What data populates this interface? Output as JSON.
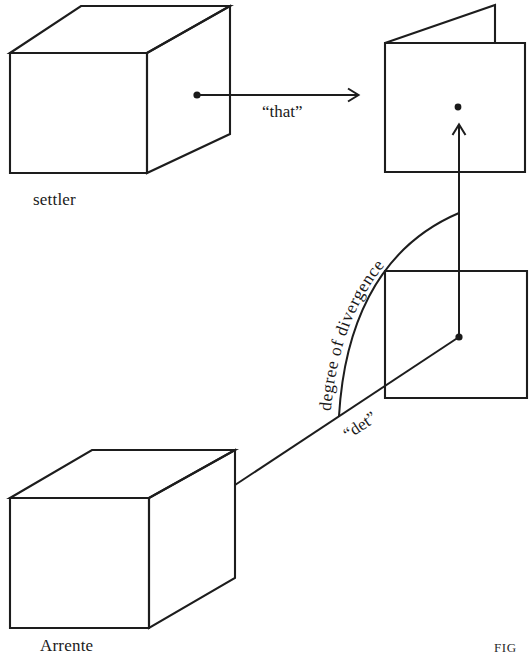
{
  "figure": {
    "caption_fragment": "FIG"
  },
  "labels": {
    "top_cube": "settler",
    "bottom_cube": "Arrente",
    "top_relation": "“that”",
    "bottom_relation": "“det”",
    "arc_label": "degree of divergence"
  },
  "shapes": {
    "settler_cube": {
      "name": "settler-cube",
      "kind": "wireframe-cube",
      "front_face": {
        "x": 10,
        "y": 53,
        "w": 137,
        "h": 120
      },
      "depth_offset": {
        "dx": 83,
        "dy": -47
      }
    },
    "arrernte_cube": {
      "name": "arrernte-cube",
      "kind": "wireframe-cube",
      "front_face": {
        "x": 10,
        "y": 498,
        "w": 139,
        "h": 130
      },
      "depth_offset": {
        "dx": 86,
        "dy": -48
      }
    },
    "folded_plane": {
      "name": "folded-plane",
      "kind": "square-with-folded-flap",
      "square": {
        "x": 385,
        "y": 43,
        "w": 140,
        "h": 129
      },
      "flap_apex": {
        "x": 495,
        "y": 5
      }
    },
    "flat_plane": {
      "name": "flat-plane",
      "kind": "square",
      "square": {
        "x": 385,
        "y": 271,
        "w": 142,
        "h": 127
      }
    }
  },
  "points": {
    "settler_origin": {
      "x": 197,
      "y": 95
    },
    "folded_plane_point": {
      "x": 458,
      "y": 107
    },
    "flat_plane_point": {
      "x": 459,
      "y": 337
    },
    "arrernte_origin": {
      "x": 235,
      "y": 485
    }
  },
  "connectors": {
    "that_arrow": {
      "name": "that-arrow",
      "from": {
        "x": 197,
        "y": 95
      },
      "to": {
        "x": 359,
        "y": 95
      },
      "arrowhead": true
    },
    "det_line": {
      "name": "det-line",
      "from": {
        "x": 235,
        "y": 485
      },
      "to": {
        "x": 459,
        "y": 337
      },
      "arrowhead": false
    },
    "vertical_link": {
      "name": "vertical-link",
      "from": {
        "x": 459,
        "y": 337
      },
      "to": {
        "x": 459,
        "y": 124
      },
      "arrowhead": true
    },
    "divergence_arc": {
      "name": "divergence-arc",
      "from": {
        "x": 338,
        "y": 415
      },
      "to": {
        "x": 459,
        "y": 214
      }
    }
  },
  "colors": {
    "ink": "#1d1d1d",
    "paper": "#ffffff"
  }
}
